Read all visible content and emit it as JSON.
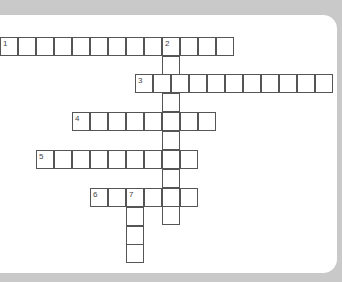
{
  "colors": {
    "background": "#c9c9c9",
    "panel": "#ffffff",
    "grid_line": "#555555"
  },
  "cell_size": 18.2,
  "words": [
    {
      "number": "1",
      "direction": "across",
      "x": 0,
      "y": 37,
      "length": 13
    },
    {
      "number": "2",
      "direction": "down",
      "x": 162,
      "y": 37,
      "length": 10
    },
    {
      "number": "3",
      "direction": "across",
      "x": 135,
      "y": 74,
      "length": 11
    },
    {
      "number": "4",
      "direction": "across",
      "x": 72,
      "y": 112,
      "length": 8
    },
    {
      "number": "5",
      "direction": "across",
      "x": 36,
      "y": 150,
      "length": 9
    },
    {
      "number": "6",
      "direction": "across",
      "x": 90,
      "y": 188,
      "length": 6
    },
    {
      "number": "7",
      "direction": "down",
      "x": 126,
      "y": 188,
      "length": 4
    }
  ]
}
